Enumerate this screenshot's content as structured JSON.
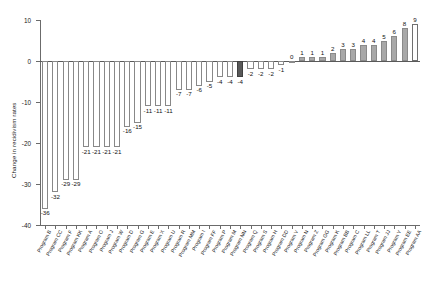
{
  "chart_data": {
    "type": "bar",
    "title": "",
    "xlabel": "",
    "ylabel": "Change in recidivism rates",
    "ylim": [
      -40,
      10
    ],
    "yticks": [
      10,
      0,
      -10,
      -20,
      -30,
      -40
    ],
    "ytick_labels": [
      "10",
      "0",
      "-10",
      "-20",
      "-30",
      "-40"
    ],
    "grid": false,
    "legend": "none",
    "zero_reference_line": true,
    "categories": [
      "Program B",
      "Program CC",
      "Program F",
      "Program KK",
      "Program A",
      "Program O",
      "Program J",
      "Program W",
      "Program D",
      "Program G",
      "Program E",
      "Program X",
      "Program U",
      "Program R",
      "Program MM",
      "Program I",
      "Program FF",
      "Program P",
      "Program M",
      "Program NN",
      "Program Q",
      "Program S",
      "Program H",
      "Program DD",
      "Program V",
      "Program N",
      "Program Z",
      "Program GG",
      "Program K",
      "Program BB",
      "Program C",
      "Program LL",
      "Program T",
      "Program JJ",
      "Program Y",
      "Program EE",
      "Program AA"
    ],
    "values": [
      -36,
      -32,
      -29,
      -29,
      -21,
      -21,
      -21,
      -21,
      -16,
      -15,
      -11,
      -11,
      -11,
      -7,
      -7,
      -6,
      -5,
      -4,
      -4,
      -4,
      -2,
      -2,
      -2,
      -1,
      0,
      1,
      1,
      1,
      2,
      3,
      3,
      4,
      4,
      5,
      6,
      8,
      9
    ],
    "value_labels": [
      "-36",
      "-32",
      "-29",
      "-29",
      "-21",
      "-21",
      "-21",
      "-21",
      "-16",
      "-15",
      "-11",
      "-11",
      "-11",
      "-7",
      "-7",
      "-6",
      "-5",
      "-4",
      "-4",
      "-4",
      "-2",
      "-2",
      "-2",
      "-1",
      "0",
      "1",
      "1",
      "1",
      "2",
      "3",
      "3",
      "4",
      "4",
      "5",
      "6",
      "8",
      "9"
    ],
    "bar_styles": [
      "neg",
      "neg",
      "neg",
      "neg",
      "neg",
      "neg",
      "neg",
      "neg",
      "neg",
      "neg",
      "neg",
      "neg",
      "neg",
      "neg",
      "neg",
      "neg",
      "neg",
      "neg",
      "neg",
      "hl",
      "neg",
      "neg",
      "neg",
      "neg",
      "pos",
      "pos",
      "pos",
      "pos",
      "pos",
      "pos",
      "pos",
      "pos",
      "pos",
      "pos",
      "pos",
      "pos",
      "open"
    ],
    "colors": {
      "negative_fill": "#ffffff",
      "negative_stroke": "#888888",
      "positive_fill": "#a8a8a8",
      "highlight_fill": "#595959",
      "axis": "#6b6b6b",
      "text": "#1a1a1a"
    }
  }
}
